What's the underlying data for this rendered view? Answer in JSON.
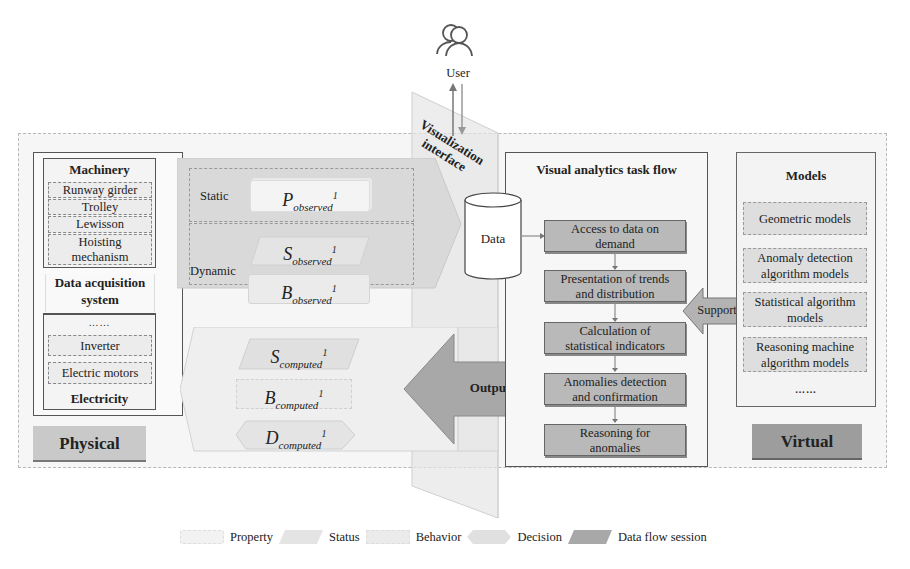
{
  "user": {
    "label": "User",
    "icon": "users-icon"
  },
  "visualization_interface": {
    "label_line1": "Visualization",
    "label_line2": "interface"
  },
  "physical": {
    "label": "Physical",
    "machinery": {
      "title": "Machinery",
      "items": [
        "Runway girder",
        "Trolley",
        "Lewisson",
        "Hoisting mechanism"
      ]
    },
    "data_acquisition": {
      "title_line1": "Data acquisition",
      "title_line2": "system"
    },
    "electricity": {
      "ellipsis": "……",
      "items": [
        "Inverter",
        "Electric motors"
      ],
      "title": "Electricity"
    }
  },
  "observed": {
    "static_label": "Static",
    "dynamic_label": "Dynamic",
    "p": {
      "base": "P",
      "sub": "observed",
      "sup": "1"
    },
    "s": {
      "base": "S",
      "sub": "observed",
      "sup": "1"
    },
    "b": {
      "base": "B",
      "sub": "observed",
      "sup": "1"
    }
  },
  "computed": {
    "s": {
      "base": "S",
      "sub": "computed",
      "sup": "1"
    },
    "b": {
      "base": "B",
      "sub": "computed",
      "sup": "1"
    },
    "d": {
      "base": "D",
      "sub": "computed",
      "sup": "1"
    }
  },
  "data_store": {
    "label": "Data"
  },
  "output_arrow": {
    "label": "Output"
  },
  "support_arrow": {
    "label": "Support"
  },
  "task_flow": {
    "title": "Visual analytics task flow",
    "steps": [
      {
        "line1": "Access to data on",
        "line2": "demand"
      },
      {
        "line1": "Presentation of trends",
        "line2": "and distribution"
      },
      {
        "line1": "Calculation of",
        "line2": "statistical indicators"
      },
      {
        "line1": "Anomalies detection",
        "line2": "and confirmation"
      },
      {
        "line1": "Reasoning for",
        "line2": "anomalies"
      }
    ]
  },
  "models": {
    "title": "Models",
    "items": [
      {
        "line1": "Geometric models",
        "line2": ""
      },
      {
        "line1": "Anomaly detection",
        "line2": "algorithm models"
      },
      {
        "line1": "Statistical algorithm",
        "line2": "models"
      },
      {
        "line1": "Reasoning machine",
        "line2": "algorithm models"
      }
    ],
    "ellipsis": "……"
  },
  "virtual": {
    "label": "Virtual"
  },
  "legend": [
    {
      "label": "Property",
      "color": "#f2f2f2"
    },
    {
      "label": "Status",
      "color": "#e4e4e4"
    },
    {
      "label": "Behavior",
      "color": "#ebebeb"
    },
    {
      "label": "Decision",
      "color": "#e0e0e0"
    },
    {
      "label": "Data flow session",
      "color": "#a8a8a8"
    }
  ],
  "colors": {
    "data_flow": "#a8a8a8",
    "step_fill": "#b9b9b9",
    "physical_label": "#c9c9c9",
    "virtual_label": "#9d9d9d"
  }
}
